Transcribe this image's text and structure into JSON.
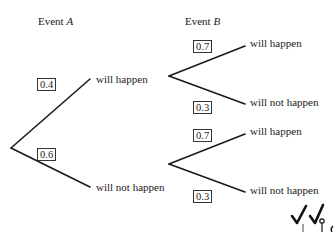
{
  "headers": {
    "event_a_prefix": "Event ",
    "event_a_var": "A",
    "event_b_prefix": "Event ",
    "event_b_var": "B"
  },
  "tree": {
    "level1": [
      {
        "probability": "0.4",
        "outcome": "will happen"
      },
      {
        "probability": "0.6",
        "outcome": "will not happen"
      }
    ],
    "level2": [
      {
        "parent": "will happen",
        "branches": [
          {
            "probability": "0.7",
            "outcome": "will happen"
          },
          {
            "probability": "0.3",
            "outcome": "will not happen"
          }
        ]
      },
      {
        "parent": "will not happen",
        "branches": [
          {
            "probability": "0.7",
            "outcome": "will happen"
          },
          {
            "probability": "0.3",
            "outcome": "will not happen"
          }
        ]
      }
    ]
  },
  "marks": {
    "check1": "✓",
    "check2": "✓"
  }
}
